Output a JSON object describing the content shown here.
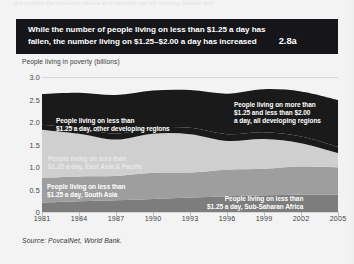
{
  "page": {
    "cutoff_text": "the people the contents above and partially cut off running header text",
    "background_color": "#f3f3f3"
  },
  "header": {
    "line1": "While the number of people living on less than $1.25 a day has",
    "line2": "fallen, the number living on $1.25–$2.00 a day has increased",
    "figure_number": "2.8a",
    "background_color": "#16161a",
    "text_color": "#ffffff"
  },
  "source": {
    "text": "Source: PovcalNet, World Bank."
  },
  "chart_data": {
    "type": "area",
    "title": "While the number of people living on less than $1.25 a day has fallen, the number living on $1.25–$2.00 a day has increased",
    "xlabel": "",
    "ylabel": "People living in poverty (billions)",
    "ylim": [
      0,
      3.0
    ],
    "xlim": [
      1981,
      2005
    ],
    "yticks": [
      "0",
      "0.5",
      "1.0",
      "1.5",
      "2.0",
      "2.5",
      "3.0"
    ],
    "ytick_values": [
      0,
      0.5,
      1.0,
      1.5,
      2.0,
      2.5,
      3.0
    ],
    "grid": true,
    "legend_position": "in-plot-labels",
    "stacked": true,
    "x": [
      1981,
      1984,
      1987,
      1990,
      1993,
      1996,
      1999,
      2002,
      2005
    ],
    "xtick_labels": [
      "1981",
      "1984",
      "1987",
      "1990",
      "1993",
      "1996",
      "1999",
      "2002",
      "2005"
    ],
    "series": [
      {
        "name": "People living on less than $1.25 a day, Sub-Saharan Africa",
        "color": "#7d7d7d",
        "values": [
          0.21,
          0.24,
          0.26,
          0.29,
          0.32,
          0.35,
          0.37,
          0.39,
          0.39
        ]
      },
      {
        "name": "People living on less than $1.25 a day, South Asia",
        "color": "#9e9e9e",
        "values": [
          0.55,
          0.55,
          0.54,
          0.58,
          0.56,
          0.59,
          0.59,
          0.62,
          0.6
        ]
      },
      {
        "name": "People living on less than $1.25 a day, East Asia & Pacific",
        "color": "#cfcfcf",
        "values": [
          1.07,
          0.95,
          0.81,
          0.87,
          0.85,
          0.64,
          0.66,
          0.52,
          0.32
        ]
      },
      {
        "name": "People living on less than $1.25 a day, other developing regions",
        "color": "#1a1a1a",
        "values": [
          0.11,
          0.12,
          0.13,
          0.13,
          0.14,
          0.15,
          0.15,
          0.15,
          0.14
        ]
      },
      {
        "name": "People living on more than $1.25 and less than $2.00 a day, all developing regions",
        "color": "#1a1a1a",
        "values": [
          0.68,
          0.79,
          0.86,
          0.83,
          0.84,
          0.9,
          0.96,
          1.0,
          1.04
        ]
      }
    ],
    "annotations": [
      "People living on less than $1.25 a day, other developing regions",
      "People living on more than $1.25 and less than $2.00 a day, all developing regions",
      "People living on less than $1.25 a day, East Asia & Pacific",
      "People living on less than $1.25 a day, South Asia",
      "People living on less than $1.25 a day, Sub-Saharan Africa"
    ]
  },
  "callouts": {
    "other_regions": {
      "line1": "People living on less than",
      "line2": "$1.25 a day, other developing regions"
    },
    "more_than": {
      "line1": "People living on more than",
      "line2": "$1.25 and less than $2.00",
      "line3": "a day, all developing regions"
    },
    "east_asia": {
      "line1": "People living on less than",
      "line2": "$1.25 a day, East Asia & Pacific"
    },
    "south_asia": {
      "line1": "People living on less than",
      "line2": "$1.25 a day, South Asia"
    },
    "sub_saharan": {
      "line1": "People living on less than",
      "line2": "$1.25 a day, Sub-Saharan Africa"
    }
  }
}
